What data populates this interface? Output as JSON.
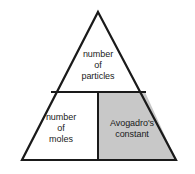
{
  "diagram": {
    "type": "formula-triangle",
    "background_color": "#ffffff",
    "outline_color": "#1a1a1a",
    "cells": [
      {
        "id": "top",
        "position": "top",
        "label": "number\nof\nparticles",
        "fill": "#ffffff",
        "shaded": false
      },
      {
        "id": "bottom-left",
        "position": "bottom-left",
        "label": "number\nof\nmoles",
        "fill": "#ffffff",
        "shaded": false
      },
      {
        "id": "bottom-right",
        "position": "bottom-right",
        "label": "Avogadro's\nconstant",
        "fill": "#c8c8c8",
        "shaded": true
      }
    ],
    "geometry": {
      "apex_x": 98,
      "apex_y": 12,
      "base_left_x": 22,
      "base_right_x": 176,
      "base_y": 160,
      "horizontal_divider_y": 92,
      "vertical_divider_x": 98
    }
  }
}
